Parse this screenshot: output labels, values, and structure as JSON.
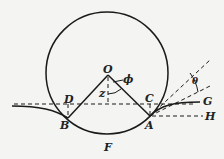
{
  "diagram": {
    "labels": {
      "O": "O",
      "phi": "ϕ",
      "z": "z",
      "D": "D",
      "C": "C",
      "B": "B",
      "A": "A",
      "F": "F",
      "G": "G",
      "H": "H",
      "theta": "θ"
    }
  }
}
